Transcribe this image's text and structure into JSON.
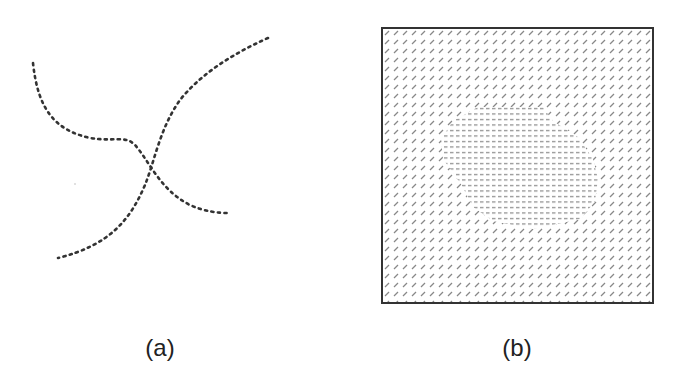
{
  "figure": {
    "panels": [
      {
        "id": "a",
        "label": "(a)",
        "description": "two crossing dotted curves"
      },
      {
        "id": "b",
        "label": "(b)",
        "description": "texture field with diagonal dashes and central region of horizontal dashes"
      }
    ]
  },
  "colors": {
    "ink": "#333333",
    "texture": "#888888"
  }
}
